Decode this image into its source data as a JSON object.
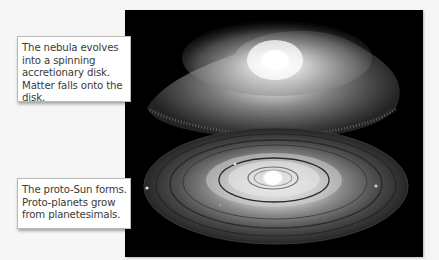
{
  "figure": {
    "stages": [
      {
        "id": "accretion-disk",
        "caption": "The nebula evolves into a spinning accretionary disk. Matter falls onto the disk.",
        "illustration": "spinning-accretionary-disk"
      },
      {
        "id": "proto-sun",
        "caption": "The proto-Sun forms. Proto-planets grow from planetesimals.",
        "illustration": "proto-sun-with-ringed-disk"
      }
    ],
    "colors": {
      "panel_background": "#000000",
      "page_background": "#f6f6f6",
      "caption_background": "#ffffff",
      "caption_border": "#b9b9b9",
      "caption_text": "#3a3a3a"
    }
  }
}
